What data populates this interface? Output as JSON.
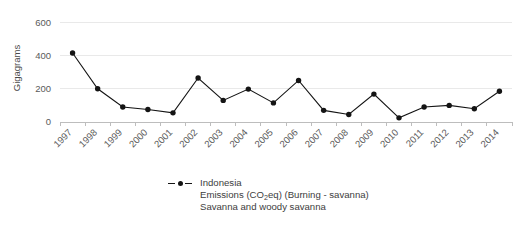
{
  "chart_data": {
    "type": "line",
    "title": "",
    "subtitle": "",
    "xlabel": "",
    "ylabel": "Gigagrams",
    "ylim": [
      0,
      650
    ],
    "yticks": [
      0,
      200,
      400,
      600
    ],
    "ytick_labels": [
      "0",
      "200",
      "400",
      "600"
    ],
    "grid": true,
    "grid_axis": "y",
    "legend_position": "bottom-center",
    "marker": "circle",
    "line_color": "#141414",
    "categories": [
      "1997",
      "1998",
      "1999",
      "2000",
      "2001",
      "2002",
      "2003",
      "2004",
      "2005",
      "2006",
      "2007",
      "2008",
      "2009",
      "2010",
      "2011",
      "2012",
      "2013",
      "2014"
    ],
    "series": [
      {
        "name": "Indonesia",
        "values": [
          415,
          200,
          90,
          75,
          55,
          265,
          130,
          198,
          115,
          250,
          70,
          45,
          168,
          25,
          90,
          100,
          80,
          185
        ]
      }
    ],
    "legend": {
      "marker_style": "dashed-line-with-dot",
      "lines": [
        "Indonesia",
        "Emissions (CO2eq) (Burning - savanna)",
        "Savanna and woody savanna"
      ],
      "line1": "Indonesia",
      "line2_pre": "Emissions (CO",
      "line2_sub": "2",
      "line2_post": "eq) (Burning - savanna)",
      "line3": "Savanna and woody savanna"
    },
    "colors": {
      "line": "#141414",
      "marker": "#141414",
      "gridline": "#e9e9e9",
      "axis": "#bdbdbd",
      "tick_text": "#5a5a5a",
      "legend_text": "#3d3d3d",
      "background": "#ffffff"
    }
  }
}
